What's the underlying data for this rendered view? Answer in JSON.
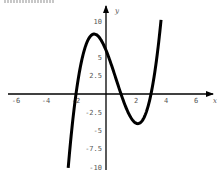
{
  "chart_data": {
    "type": "line",
    "title": "",
    "xlabel": "x",
    "ylabel": "y",
    "xlim": [
      -6.6,
      7.1
    ],
    "ylim": [
      -10,
      11.5
    ],
    "grid": false,
    "legend": "none",
    "x_ticks": [
      {
        "value": -6,
        "label": "-6"
      },
      {
        "value": -4,
        "label": "-4"
      },
      {
        "value": -2,
        "label": "-2"
      },
      {
        "value": 2,
        "label": "2"
      },
      {
        "value": 4,
        "label": "4"
      },
      {
        "value": 6,
        "label": "6"
      }
    ],
    "y_ticks": [
      {
        "value": 10,
        "label": "10"
      },
      {
        "value": 5,
        "label": "5"
      },
      {
        "value": 2.5,
        "label": "2.5"
      },
      {
        "value": -2.5,
        "label": "-2.5"
      },
      {
        "value": -5,
        "label": "-5"
      },
      {
        "value": -7.5,
        "label": "-7.5"
      },
      {
        "value": -10,
        "label": "-10"
      }
    ],
    "series": [
      {
        "name": "f(x) = (x+2)(x-1)(x-3)",
        "color": "#000000",
        "function_coefficients_cubic": [
          1,
          -2,
          -5,
          6
        ],
        "domain": [
          -2.52,
          3.67
        ],
        "key_points": {
          "roots": [
            -2,
            1,
            3
          ],
          "y_intercept": 6,
          "local_max": [
            -0.79,
            8.2
          ],
          "local_min": [
            2.12,
            -4.06
          ]
        }
      }
    ]
  }
}
